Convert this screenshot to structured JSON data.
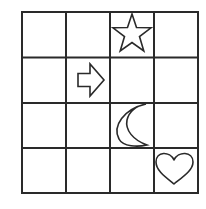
{
  "puzzle": {
    "rows": 4,
    "cols": 4,
    "line_color": "#2a2a2a",
    "background": "#ffffff",
    "cells": [
      {
        "row": 0,
        "col": 2,
        "symbol": "star",
        "icon": "star-icon"
      },
      {
        "row": 1,
        "col": 1,
        "symbol": "arrow-right",
        "icon": "arrow-right-icon"
      },
      {
        "row": 2,
        "col": 2,
        "symbol": "crescent-moon",
        "icon": "crescent-moon-icon"
      },
      {
        "row": 3,
        "col": 3,
        "symbol": "heart",
        "icon": "heart-icon"
      }
    ]
  }
}
